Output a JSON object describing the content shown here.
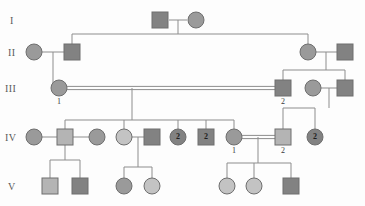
{
  "figure": {
    "type": "pedigree-chart",
    "width": 365,
    "height": 206,
    "background": "#fdfdfd"
  },
  "style": {
    "line_color": "#8d8d8d",
    "shape_stroke": "#6e6e6e",
    "fill_dark": "#828282",
    "fill_medium": "#9a9a9a",
    "fill_light": "#b4b4b4",
    "fill_pale": "#c3c3c3",
    "label_color": "#5a5a5a"
  },
  "generations": [
    {
      "id": "gen-1",
      "label": "I",
      "label_x": 10,
      "label_y": 24,
      "row_y": 20
    },
    {
      "id": "gen-2",
      "label": "II",
      "label_x": 8,
      "label_y": 56,
      "row_y": 52
    },
    {
      "id": "gen-3",
      "label": "III",
      "label_x": 5,
      "label_y": 92,
      "row_y": 88
    },
    {
      "id": "gen-4",
      "label": "IV",
      "label_x": 5,
      "label_y": 141,
      "row_y": 137
    },
    {
      "id": "gen-5",
      "label": "V",
      "label_x": 8,
      "label_y": 190,
      "row_y": 186
    }
  ],
  "individuals": [
    {
      "key": "I-1",
      "sex": "male",
      "x": 160,
      "y": 20,
      "fill": "fill_dark",
      "id_label": "",
      "count": ""
    },
    {
      "key": "I-2",
      "sex": "female",
      "x": 196,
      "y": 20,
      "fill": "fill_medium",
      "id_label": "",
      "count": ""
    },
    {
      "key": "II-1",
      "sex": "female",
      "x": 34,
      "y": 52,
      "fill": "fill_medium",
      "id_label": "",
      "count": ""
    },
    {
      "key": "II-2",
      "sex": "male",
      "x": 72,
      "y": 52,
      "fill": "fill_dark",
      "id_label": "",
      "count": ""
    },
    {
      "key": "II-3",
      "sex": "female",
      "x": 308,
      "y": 52,
      "fill": "fill_medium",
      "id_label": "",
      "count": ""
    },
    {
      "key": "II-4",
      "sex": "male",
      "x": 345,
      "y": 52,
      "fill": "fill_dark",
      "id_label": "",
      "count": ""
    },
    {
      "key": "III-1",
      "sex": "female",
      "x": 59,
      "y": 88,
      "fill": "fill_medium",
      "id_label": "1",
      "count": ""
    },
    {
      "key": "III-2",
      "sex": "male",
      "x": 283,
      "y": 88,
      "fill": "fill_dark",
      "id_label": "2",
      "count": ""
    },
    {
      "key": "III-3",
      "sex": "female",
      "x": 313,
      "y": 88,
      "fill": "fill_medium",
      "id_label": "",
      "count": ""
    },
    {
      "key": "III-4",
      "sex": "male",
      "x": 345,
      "y": 88,
      "fill": "fill_dark",
      "id_label": "",
      "count": ""
    },
    {
      "key": "IV-1",
      "sex": "female",
      "x": 34,
      "y": 137,
      "fill": "fill_medium",
      "id_label": "",
      "count": ""
    },
    {
      "key": "IV-2",
      "sex": "male",
      "x": 65,
      "y": 137,
      "fill": "fill_light",
      "id_label": "",
      "count": ""
    },
    {
      "key": "IV-3",
      "sex": "female",
      "x": 97,
      "y": 137,
      "fill": "fill_medium",
      "id_label": "",
      "count": ""
    },
    {
      "key": "IV-4",
      "sex": "female",
      "x": 124,
      "y": 137,
      "fill": "fill_pale",
      "id_label": "",
      "count": ""
    },
    {
      "key": "IV-5",
      "sex": "male",
      "x": 152,
      "y": 137,
      "fill": "fill_dark",
      "id_label": "",
      "count": ""
    },
    {
      "key": "IV-6",
      "sex": "female",
      "x": 178,
      "y": 137,
      "fill": "fill_dark",
      "id_label": "",
      "count": "2"
    },
    {
      "key": "IV-7",
      "sex": "male",
      "x": 206,
      "y": 137,
      "fill": "fill_dark",
      "id_label": "",
      "count": "2"
    },
    {
      "key": "IV-8",
      "sex": "female",
      "x": 234,
      "y": 137,
      "fill": "fill_medium",
      "id_label": "1",
      "count": ""
    },
    {
      "key": "IV-9",
      "sex": "male",
      "x": 283,
      "y": 137,
      "fill": "fill_light",
      "id_label": "2",
      "count": ""
    },
    {
      "key": "IV-10",
      "sex": "female",
      "x": 315,
      "y": 137,
      "fill": "fill_dark",
      "id_label": "",
      "count": "2"
    },
    {
      "key": "V-1",
      "sex": "male",
      "x": 50,
      "y": 186,
      "fill": "fill_light",
      "id_label": "",
      "count": ""
    },
    {
      "key": "V-2",
      "sex": "male",
      "x": 80,
      "y": 186,
      "fill": "fill_dark",
      "id_label": "",
      "count": ""
    },
    {
      "key": "V-3",
      "sex": "female",
      "x": 124,
      "y": 186,
      "fill": "fill_medium",
      "id_label": "",
      "count": ""
    },
    {
      "key": "V-4",
      "sex": "female",
      "x": 152,
      "y": 186,
      "fill": "fill_pale",
      "id_label": "",
      "count": ""
    },
    {
      "key": "V-5",
      "sex": "female",
      "x": 227,
      "y": 186,
      "fill": "fill_pale",
      "id_label": "",
      "count": ""
    },
    {
      "key": "V-6",
      "sex": "female",
      "x": 254,
      "y": 186,
      "fill": "fill_pale",
      "id_label": "",
      "count": ""
    },
    {
      "key": "V-7",
      "sex": "male",
      "x": 291,
      "y": 186,
      "fill": "fill_dark",
      "id_label": "",
      "count": ""
    }
  ],
  "connections": {
    "mating_lines": [
      {
        "key": "mate-I-1-I-2",
        "x1": 169,
        "y1": 20,
        "x2": 187,
        "y2": 20,
        "double": false
      },
      {
        "key": "mate-II-1-II-2",
        "x1": 42,
        "y1": 52,
        "x2": 64,
        "y2": 52,
        "double": false
      },
      {
        "key": "mate-II-3-II-4",
        "x1": 316,
        "y1": 52,
        "x2": 337,
        "y2": 52,
        "double": false
      },
      {
        "key": "mate-III-1-III-2",
        "x1": 67,
        "y1": 88,
        "x2": 275,
        "y2": 88,
        "double": true
      },
      {
        "key": "mate-III-3-III-4",
        "x1": 321,
        "y1": 88,
        "x2": 337,
        "y2": 88,
        "double": false
      },
      {
        "key": "mate-IV-1-IV-2",
        "x1": 42,
        "y1": 137,
        "x2": 57,
        "y2": 137,
        "double": false
      },
      {
        "key": "mate-IV-2-IV-3",
        "x1": 73,
        "y1": 137,
        "x2": 89,
        "y2": 137,
        "double": false
      },
      {
        "key": "mate-IV-4-IV-5",
        "x1": 132,
        "y1": 137,
        "x2": 144,
        "y2": 137,
        "double": false
      },
      {
        "key": "mate-IV-8-IV-9",
        "x1": 242,
        "y1": 137,
        "x2": 275,
        "y2": 137,
        "double": true
      }
    ],
    "sibship_drops": [
      {
        "key": "drop-I-to-II",
        "x": 178,
        "y1": 20,
        "y2": 34
      },
      {
        "key": "drop-II1-to-III",
        "x": 53,
        "y1": 52,
        "y2": 88
      },
      {
        "key": "drop-II3-to-III",
        "x": 326,
        "y1": 52,
        "y2": 70
      },
      {
        "key": "drop-III-to-IV",
        "x": 132,
        "y1": 88,
        "y2": 120
      },
      {
        "key": "drop-III3-to-IV",
        "x": 329,
        "y1": 88,
        "y2": 108
      },
      {
        "key": "drop-IV2-to-V",
        "x": 65,
        "y1": 137,
        "y2": 160
      },
      {
        "key": "drop-IV45-to-V",
        "x": 138,
        "y1": 137,
        "y2": 167
      },
      {
        "key": "drop-IV89-to-V",
        "x": 258,
        "y1": 137,
        "y2": 163
      }
    ],
    "sibship_bars": [
      {
        "key": "bar-gen-II",
        "y": 34,
        "x1": 72,
        "x2": 308
      },
      {
        "key": "bar-gen-III",
        "y": 70,
        "x1": 283,
        "x2": 345
      },
      {
        "key": "bar-gen-IV",
        "y": 120,
        "x1": 65,
        "x2": 234
      },
      {
        "key": "bar-gen-IV-right",
        "y": 108,
        "x1": 283,
        "x2": 315
      },
      {
        "key": "bar-gen-V-a",
        "y": 160,
        "x1": 50,
        "x2": 80
      },
      {
        "key": "bar-gen-V-b",
        "y": 167,
        "x1": 124,
        "x2": 152
      },
      {
        "key": "bar-gen-V-c",
        "y": 163,
        "x1": 227,
        "x2": 291
      }
    ],
    "child_stems": [
      {
        "key": "stem-II-1",
        "x": 72,
        "y1": 34,
        "y2": 44
      },
      {
        "key": "stem-II-3",
        "x": 308,
        "y1": 34,
        "y2": 44
      },
      {
        "key": "stem-III-2",
        "x": 283,
        "y1": 70,
        "y2": 80
      },
      {
        "key": "stem-III-4",
        "x": 345,
        "y1": 70,
        "y2": 80
      },
      {
        "key": "stem-IV-2",
        "x": 65,
        "y1": 120,
        "y2": 129
      },
      {
        "key": "stem-IV-4",
        "x": 124,
        "y1": 120,
        "y2": 129
      },
      {
        "key": "stem-IV-6",
        "x": 178,
        "y1": 120,
        "y2": 129
      },
      {
        "key": "stem-IV-7",
        "x": 206,
        "y1": 120,
        "y2": 129
      },
      {
        "key": "stem-IV-8",
        "x": 234,
        "y1": 120,
        "y2": 129
      },
      {
        "key": "stem-IV-9",
        "x": 283,
        "y1": 108,
        "y2": 129
      },
      {
        "key": "stem-IV-10",
        "x": 315,
        "y1": 108,
        "y2": 129
      },
      {
        "key": "stem-V-1",
        "x": 50,
        "y1": 160,
        "y2": 178
      },
      {
        "key": "stem-V-2",
        "x": 80,
        "y1": 160,
        "y2": 178
      },
      {
        "key": "stem-V-3",
        "x": 124,
        "y1": 167,
        "y2": 178
      },
      {
        "key": "stem-V-4",
        "x": 152,
        "y1": 167,
        "y2": 178
      },
      {
        "key": "stem-V-5",
        "x": 227,
        "y1": 163,
        "y2": 178
      },
      {
        "key": "stem-V-6",
        "x": 254,
        "y1": 163,
        "y2": 178
      },
      {
        "key": "stem-V-7",
        "x": 291,
        "y1": 163,
        "y2": 178
      }
    ]
  }
}
